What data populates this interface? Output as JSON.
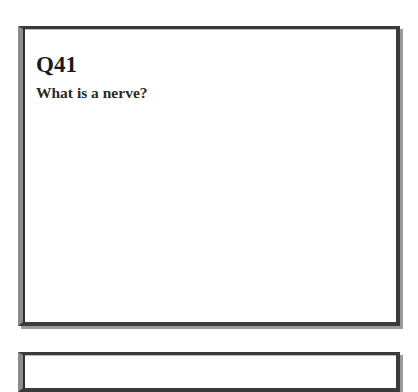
{
  "cards": [
    {
      "number": "Q41",
      "question": "What is a nerve?"
    }
  ],
  "colors": {
    "frame_dark": "#3a3a3a",
    "frame_gray": "#8c8c8c",
    "text": "#1a1a1a"
  }
}
